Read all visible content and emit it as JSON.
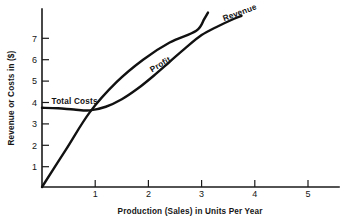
{
  "chart_data": {
    "type": "line",
    "title": "",
    "xlabel": "Production (Sales) in Units Per Year",
    "ylabel": "Revenue or Costs in ($)",
    "xlim": [
      0,
      5.6
    ],
    "ylim": [
      0,
      8.2
    ],
    "xticks": [
      1,
      2,
      3,
      4,
      5
    ],
    "yticks": [
      1,
      2,
      3,
      4,
      5,
      6,
      7
    ],
    "xtick_labels": [
      "1",
      "2",
      "3",
      "4",
      "5"
    ],
    "ytick_labels": [
      "1",
      "2",
      "3",
      "4",
      "5",
      "6",
      "7"
    ],
    "grid": false,
    "legend": "none",
    "annotations": [
      {
        "name": "total-costs-label",
        "text": "Total Costs",
        "x": 0.18,
        "y": 3.9,
        "rotation": 0
      },
      {
        "name": "profit-label",
        "text": "Profit",
        "x": 2.07,
        "y": 5.35,
        "rotation": -31
      },
      {
        "name": "revenue-label",
        "text": "Revenue",
        "x": 3.42,
        "y": 7.75,
        "rotation": -20
      }
    ],
    "series": [
      {
        "name": "Total Costs",
        "label": "Total Costs",
        "color": "#111111",
        "x": [
          0.0,
          0.3,
          0.6,
          0.9,
          1.2,
          1.5,
          1.8,
          2.1,
          2.4,
          2.7,
          3.0,
          3.3,
          3.6,
          3.75
        ],
        "y": [
          3.7,
          3.68,
          3.62,
          3.58,
          3.75,
          4.1,
          4.6,
          5.2,
          5.85,
          6.5,
          7.1,
          7.5,
          7.85,
          8.0
        ]
      },
      {
        "name": "Revenue",
        "label": "Revenue",
        "color": "#111111",
        "x": [
          0.0,
          0.45,
          0.9,
          1.4,
          1.9,
          2.4,
          2.9,
          3.05,
          3.12
        ],
        "y": [
          0.0,
          1.75,
          3.5,
          4.9,
          5.95,
          6.75,
          7.3,
          7.85,
          8.15
        ]
      }
    ],
    "notes": {
      "breakeven_point": {
        "x": 0.9,
        "y": 3.55
      },
      "second_crossing": {
        "x": 2.93,
        "y": 7.15
      }
    }
  },
  "figure": {
    "background_color": "#ffffff",
    "line_color": "#111111",
    "text_color": "#151515"
  }
}
